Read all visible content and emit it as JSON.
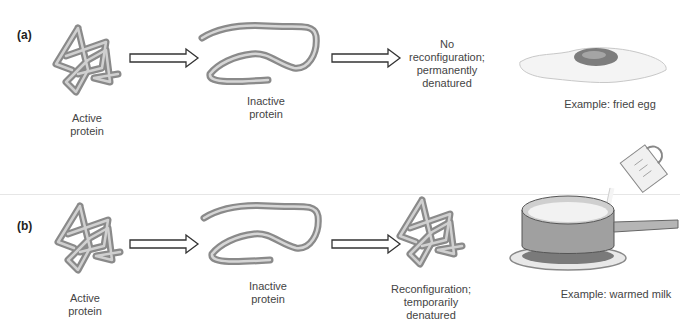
{
  "diagram": {
    "panels": [
      {
        "label": "(a)",
        "stages": [
          {
            "caption_lines": [
              "Active",
              "protein"
            ],
            "shape": "folded-protein"
          },
          {
            "caption_lines": [
              "Inactive",
              "protein"
            ],
            "shape": "unfolded-protein"
          },
          {
            "caption_lines": [
              "No",
              "reconfiguration;",
              "permanently",
              "denatured"
            ],
            "shape": "none"
          }
        ],
        "example": {
          "caption": "Example: fried egg",
          "shape": "fried-egg"
        }
      },
      {
        "label": "(b)",
        "stages": [
          {
            "caption_lines": [
              "Active",
              "protein"
            ],
            "shape": "folded-protein"
          },
          {
            "caption_lines": [
              "Inactive",
              "protein"
            ],
            "shape": "unfolded-protein"
          },
          {
            "caption_lines": [
              "Reconfiguration;",
              "temporarily",
              "denatured"
            ],
            "shape": "refolded-protein"
          }
        ],
        "example": {
          "caption": "Example: warmed milk",
          "shape": "pan-of-milk"
        }
      }
    ],
    "colors": {
      "protein": "#a9a9a9",
      "protein_dark": "#6e6e6e",
      "arrow_stroke": "#333333",
      "divider": "#e6e6e6"
    }
  }
}
